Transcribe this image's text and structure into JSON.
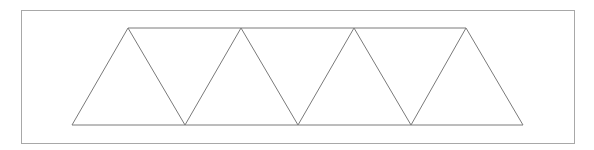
{
  "diagram": {
    "stroke_color": "#7a7a7a",
    "frame": {
      "x": 21,
      "y": 10,
      "width": 553,
      "height": 133,
      "stroke": "#a8a8a8"
    },
    "top_chord": {
      "x1": 128,
      "y1": 28,
      "x2": 466,
      "y2": 28
    },
    "bottom_chord": {
      "x1": 72,
      "y1": 125,
      "x2": 523,
      "y2": 125
    },
    "top_nodes": [
      128,
      241,
      354,
      466
    ],
    "bottom_nodes": [
      72,
      185,
      298,
      411,
      523
    ],
    "top_y": 28,
    "bottom_y": 125
  }
}
